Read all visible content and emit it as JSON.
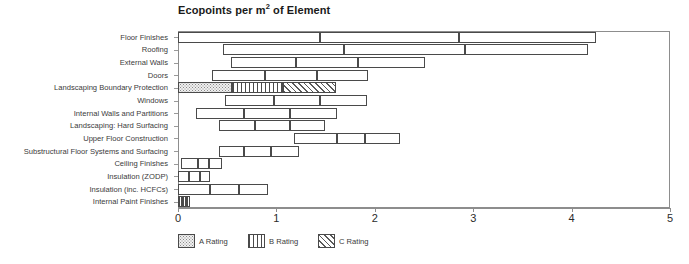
{
  "chart_data": {
    "type": "bar",
    "title": "Ecopoints per m2 of Element",
    "title_prefix": "Ecopoints per m",
    "title_sup": "2",
    "title_suffix": " of Element",
    "xlabel": "",
    "ylabel": "",
    "xlim": [
      0,
      5
    ],
    "xticks": [
      0,
      1,
      2,
      3,
      4,
      5
    ],
    "xticklabels": [
      "0",
      "1",
      "2",
      "3",
      "4",
      "5"
    ],
    "grid": false,
    "orientation": "horizontal",
    "stacked": true,
    "note": "Each category is a floating stacked bar: a start offset followed by three adjoining rating segments (A, B, C).",
    "categories": [
      "Floor Finishes",
      "Roofing",
      "External Walls",
      "Doors",
      "Landscaping Boundary Protection",
      "Windows",
      "Internal Walls and Partitions",
      "Landscaping: Hard Surfacing",
      "Upper Floor Construction",
      "Substructural Floor Systems and Surfacing",
      "Ceiling Finishes",
      "Insulation (ZODP)",
      "Insulation (inc. HCFCs)",
      "Internal Paint Finishes"
    ],
    "series": [
      {
        "name": "start",
        "values": [
          0.0,
          0.46,
          0.54,
          0.35,
          0.0,
          0.48,
          0.18,
          0.42,
          1.18,
          0.42,
          0.03,
          0.0,
          0.0,
          0.0
        ]
      },
      {
        "name": "A Rating",
        "values": [
          1.44,
          1.23,
          0.66,
          0.53,
          0.55,
          0.5,
          0.49,
          0.36,
          0.44,
          0.25,
          0.17,
          0.11,
          0.33,
          0.04
        ]
      },
      {
        "name": "B Rating",
        "values": [
          1.42,
          1.23,
          0.63,
          0.53,
          0.52,
          0.46,
          0.47,
          0.36,
          0.28,
          0.28,
          0.12,
          0.11,
          0.29,
          0.04
        ]
      },
      {
        "name": "C Rating",
        "values": [
          1.39,
          1.25,
          0.68,
          0.52,
          0.54,
          0.48,
          0.48,
          0.35,
          0.36,
          0.28,
          0.13,
          0.11,
          0.29,
          0.04
        ]
      }
    ],
    "bar_extents": [
      {
        "category": "Floor Finishes",
        "start": 0.0,
        "a_end": 1.44,
        "b_end": 2.86,
        "end": 4.25,
        "fill": "none"
      },
      {
        "category": "Roofing",
        "start": 0.46,
        "a_end": 1.69,
        "b_end": 2.92,
        "end": 4.17,
        "fill": "none"
      },
      {
        "category": "External Walls",
        "start": 0.54,
        "a_end": 1.2,
        "b_end": 1.83,
        "end": 2.51,
        "fill": "none"
      },
      {
        "category": "Doors",
        "start": 0.35,
        "a_end": 0.88,
        "b_end": 1.41,
        "end": 1.93,
        "fill": "none"
      },
      {
        "category": "Landscaping Boundary Protection",
        "start": 0.0,
        "a_end": 0.55,
        "b_end": 1.07,
        "end": 1.61,
        "fill": "hatched"
      },
      {
        "category": "Windows",
        "start": 0.48,
        "a_end": 0.98,
        "b_end": 1.44,
        "end": 1.92,
        "fill": "none"
      },
      {
        "category": "Internal Walls and Partitions",
        "start": 0.18,
        "a_end": 0.67,
        "b_end": 1.14,
        "end": 1.62,
        "fill": "none"
      },
      {
        "category": "Landscaping: Hard Surfacing",
        "start": 0.42,
        "a_end": 0.78,
        "b_end": 1.14,
        "end": 1.49,
        "fill": "none"
      },
      {
        "category": "Upper Floor Construction",
        "start": 1.18,
        "a_end": 1.62,
        "b_end": 1.9,
        "end": 2.26,
        "fill": "none"
      },
      {
        "category": "Substructural Floor Systems and Surfacing",
        "start": 0.42,
        "a_end": 0.67,
        "b_end": 0.95,
        "end": 1.23,
        "fill": "none"
      },
      {
        "category": "Ceiling Finishes",
        "start": 0.03,
        "a_end": 0.2,
        "b_end": 0.32,
        "end": 0.45,
        "fill": "none"
      },
      {
        "category": "Insulation (ZODP)",
        "start": 0.0,
        "a_end": 0.11,
        "b_end": 0.22,
        "end": 0.33,
        "fill": "none"
      },
      {
        "category": "Insulation (inc. HCFCs)",
        "start": 0.0,
        "a_end": 0.33,
        "b_end": 0.62,
        "end": 0.91,
        "fill": "none"
      },
      {
        "category": "Internal Paint Finishes",
        "start": 0.0,
        "a_end": 0.04,
        "b_end": 0.08,
        "end": 0.12,
        "fill": "vertical"
      }
    ],
    "legend": {
      "position": "bottom",
      "entries": [
        {
          "label": "A Rating",
          "pattern": "dotted"
        },
        {
          "label": "B Rating",
          "pattern": "vertical-lines"
        },
        {
          "label": "C Rating",
          "pattern": "diagonal-hatch"
        }
      ]
    },
    "colors": {
      "background": "#ffffff",
      "bar_outline": "#4a4a4a",
      "axis": "#8d8d8d",
      "text": "#3b3b3b",
      "title": "#1a1a1a"
    }
  }
}
